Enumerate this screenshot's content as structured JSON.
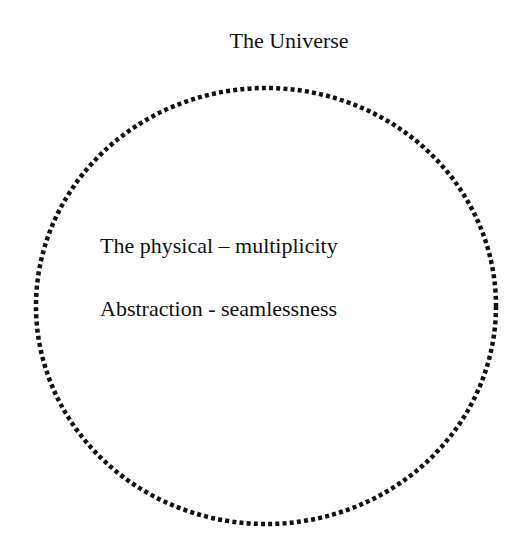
{
  "diagram": {
    "title": "The Universe",
    "boundary": {
      "shape": "ellipse",
      "style": "dotted",
      "color": "#111111",
      "cx": 266,
      "cy": 306,
      "rx": 230,
      "ry": 218
    },
    "contents": [
      {
        "label": "The physical – multiplicity"
      },
      {
        "label": "Abstraction - seamlessness"
      }
    ]
  }
}
